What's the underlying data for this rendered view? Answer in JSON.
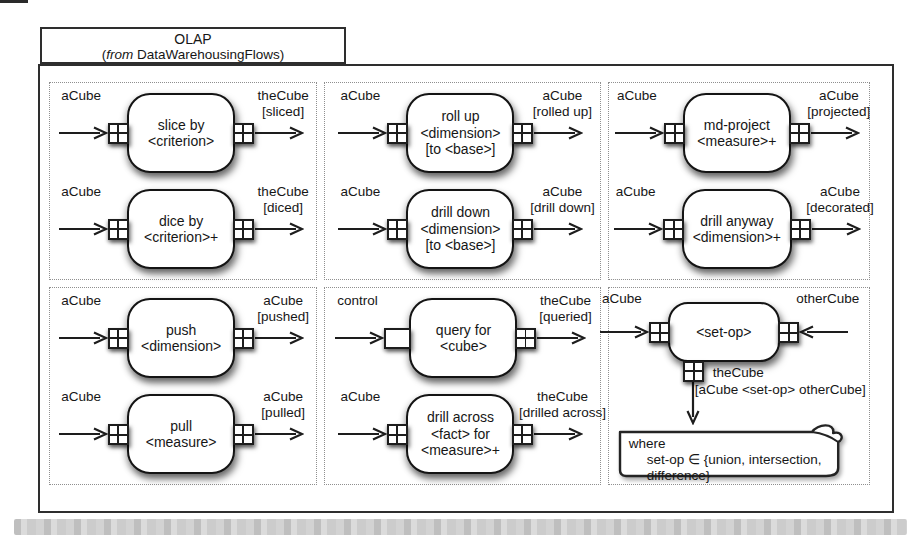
{
  "package": {
    "title": "OLAP",
    "subtitle_open": "(",
    "subtitle_italic": "from",
    "subtitle_rest": " DataWarehousingFlows)"
  },
  "cells": [
    {
      "nodes": [
        {
          "input": "aCube",
          "lines": [
            "slice by",
            "<criterion>"
          ],
          "out": [
            "theCube",
            "[sliced]"
          ]
        },
        {
          "input": "aCube",
          "lines": [
            "dice by",
            "<criterion>+"
          ],
          "out": [
            "theCube",
            "[diced]"
          ]
        }
      ]
    },
    {
      "nodes": [
        {
          "input": "aCube",
          "lines": [
            "roll up",
            "<dimension>",
            "[to <base>]"
          ],
          "out": [
            "aCube",
            "[rolled up]"
          ]
        },
        {
          "input": "aCube",
          "lines": [
            "drill down",
            "<dimension>",
            "[to <base>]"
          ],
          "out": [
            "aCube",
            "[drill down]"
          ]
        }
      ]
    },
    {
      "nodes": [
        {
          "input": "aCube",
          "lines": [
            "md-project",
            "<measure>+"
          ],
          "out": [
            "aCube",
            "[projected]"
          ]
        },
        {
          "input": "aCube",
          "lines": [
            "drill anyway",
            "<dimension>+"
          ],
          "out": [
            "aCube",
            "[decorated]"
          ]
        }
      ]
    },
    {
      "nodes": [
        {
          "input": "aCube",
          "lines": [
            "push",
            "<dimension>"
          ],
          "out": [
            "aCube",
            "[pushed]"
          ]
        },
        {
          "input": "aCube",
          "lines": [
            "pull",
            "<measure>"
          ],
          "out": [
            "aCube",
            "[pulled]"
          ]
        }
      ]
    },
    {
      "nodes": [
        {
          "input": "control",
          "lines": [
            "query for",
            "<cube>"
          ],
          "out": [
            "theCube",
            "[queried]"
          ]
        },
        {
          "input": "aCube",
          "lines": [
            "drill across",
            "<fact> for",
            "<measure>+"
          ],
          "out": [
            "theCube",
            "[drilled across]"
          ]
        }
      ]
    },
    {
      "setop": {
        "left_input": "aCube",
        "right_input": "otherCube",
        "title": "<set-op>",
        "out": [
          "theCube",
          "[aCube <set-op> otherCube]"
        ]
      },
      "note": {
        "line1": "where",
        "line2": "set-op ∈ {union, intersection, difference}"
      }
    }
  ]
}
